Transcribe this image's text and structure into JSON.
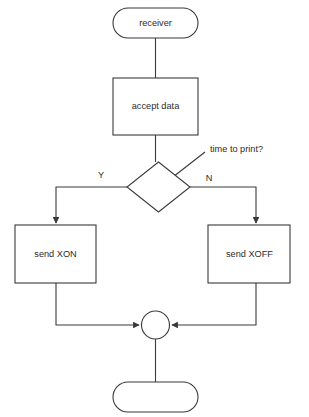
{
  "diagram": {
    "type": "flowchart",
    "title": "",
    "background_color": "#ffffff",
    "line_color": "#3a3a3a",
    "text_color": "#2b2b2b",
    "nodes": {
      "start_terminal": {
        "label": "receiver",
        "shape": "stadium"
      },
      "accept_process": {
        "label": "accept data",
        "shape": "rectangle"
      },
      "decision": {
        "label": "",
        "shape": "diamond"
      },
      "xon_process": {
        "label": "send XON",
        "shape": "rectangle"
      },
      "xoff_process": {
        "label": "send XOFF",
        "shape": "rectangle"
      },
      "merge_connector": {
        "label": "",
        "shape": "circle"
      },
      "end_terminal": {
        "label": "",
        "shape": "stadium"
      }
    },
    "edge_labels": {
      "yes": "Y",
      "no": "N"
    },
    "annotations": {
      "decision_note": "time to print?"
    }
  }
}
